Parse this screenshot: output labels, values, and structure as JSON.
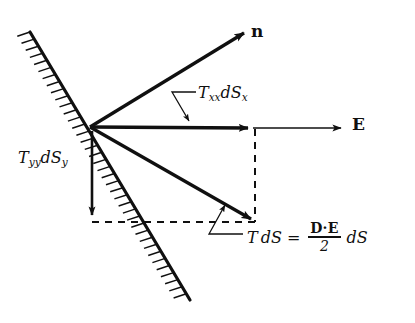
{
  "figure": {
    "kind": "vector-force-diagram",
    "background_color": "#ffffff",
    "ink_color": "#101010",
    "width": 415,
    "height": 323
  },
  "labels": {
    "normal_vector": "n",
    "field_vector": "E",
    "stress_x": {
      "symbol": "T",
      "sub1": "xx",
      "d": "d",
      "s": "S",
      "sub2": "x"
    },
    "stress_y": {
      "symbol": "T",
      "sub1": "yy",
      "d": "d",
      "s": "S",
      "sub2": "y"
    },
    "equation": {
      "lhs_T": "T",
      "lhs_dS": "dS",
      "equals": "=",
      "numerator": "D·E",
      "denominator": "2",
      "trailing_dS": "dS"
    }
  },
  "geometry": {
    "origin": {
      "x": 90,
      "y": 127
    },
    "surface_line": {
      "x1": 30,
      "y1": 32,
      "x2": 190,
      "y2": 300
    },
    "vectors": [
      {
        "name": "n",
        "x1": 90,
        "y1": 127,
        "x2": 247,
        "y2": 31
      },
      {
        "name": "E",
        "x1": 90,
        "y1": 127,
        "x2": 255,
        "y2": 128
      },
      {
        "name": "TdS",
        "x1": 90,
        "y1": 127,
        "x2": 255,
        "y2": 221
      },
      {
        "name": "TyydSy",
        "x1": 92,
        "y1": 131,
        "x2": 92,
        "y2": 220
      }
    ],
    "dashed": [
      {
        "name": "vertical",
        "x1": 255,
        "y1": 128,
        "x2": 255,
        "y2": 222
      },
      {
        "name": "horizontal",
        "x1": 92,
        "y1": 222,
        "x2": 255,
        "y2": 222
      }
    ],
    "e_tail_extension": {
      "x1": 255,
      "y1": 128,
      "x2": 345,
      "y2": 128
    }
  }
}
